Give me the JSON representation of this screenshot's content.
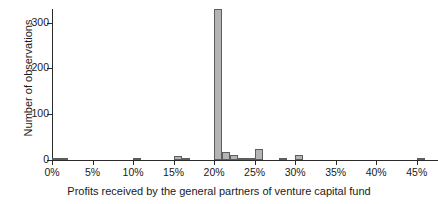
{
  "chart_data": {
    "type": "bar",
    "title": "",
    "xlabel": "Profits received by the general partners of venture capital fund",
    "ylabel": "Number of observations",
    "xlim": [
      0,
      47.5
    ],
    "ylim": [
      0,
      330
    ],
    "grid": false,
    "legend": null,
    "bin_width": 1,
    "xtick_labels": [
      "0%",
      "5%",
      "10%",
      "15%",
      "20%",
      "25%",
      "30%",
      "35%",
      "40%",
      "45%"
    ],
    "xtick_values": [
      0,
      5,
      10,
      15,
      20,
      25,
      30,
      35,
      40,
      45
    ],
    "ytick_labels": [
      "0",
      "100",
      "200",
      "300"
    ],
    "ytick_values": [
      0,
      100,
      200,
      300
    ],
    "x": [
      0,
      1,
      2,
      3,
      4,
      5,
      6,
      7,
      8,
      9,
      10,
      11,
      12,
      13,
      14,
      15,
      16,
      17,
      18,
      19,
      20,
      21,
      22,
      23,
      24,
      25,
      26,
      27,
      28,
      29,
      30,
      31,
      32,
      33,
      34,
      35,
      36,
      37,
      38,
      39,
      40,
      41,
      42,
      43,
      44,
      45,
      46
    ],
    "values": [
      2,
      2,
      0,
      0,
      0,
      0,
      0,
      0,
      0,
      0,
      4,
      0,
      0,
      0,
      0,
      8,
      1,
      0,
      0,
      0,
      330,
      17,
      12,
      1,
      1,
      25,
      0,
      0,
      1,
      0,
      10,
      0,
      0,
      0,
      0,
      0,
      0,
      0,
      0,
      0,
      0,
      0,
      0,
      0,
      0,
      2,
      0
    ],
    "bar_color": "#b4b4b4",
    "bar_edge_color": "#5e5e5e",
    "axis_color": "#2b2b2b",
    "background": "#ffffff"
  }
}
